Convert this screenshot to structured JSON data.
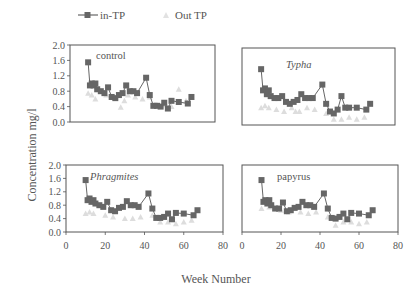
{
  "legend": {
    "in_label": "in-TP",
    "out_label": "Out TP"
  },
  "axes": {
    "ylabel": "Concentration mg/l",
    "xlabel": "Week Number",
    "yticks": [
      "0.0",
      "0.4",
      "0.8",
      "1.2",
      "1.6",
      "2.0"
    ],
    "xticks": [
      "0",
      "20",
      "40",
      "60",
      "80"
    ]
  },
  "colors": {
    "in": "#666666",
    "out": "#dddddd",
    "frame": "#555555"
  },
  "chart_data": [
    {
      "type": "line",
      "title": "control",
      "xlabel": "Week Number",
      "ylabel": "Concentration mg/l",
      "xlim": [
        0,
        80
      ],
      "ylim": [
        0,
        2.0
      ],
      "series": [
        {
          "name": "in-TP",
          "x": [
            10,
            11,
            12,
            13,
            14,
            15,
            17,
            19,
            21,
            23,
            25,
            27,
            29,
            31,
            33,
            35,
            37,
            42,
            44,
            46,
            48,
            50,
            52,
            54,
            56,
            60,
            65,
            67
          ],
          "y": [
            1.55,
            0.95,
            1.0,
            0.95,
            1.0,
            0.85,
            0.8,
            0.75,
            0.9,
            0.65,
            0.62,
            0.7,
            0.75,
            0.95,
            0.8,
            0.8,
            0.75,
            1.15,
            0.7,
            0.42,
            0.42,
            0.4,
            0.5,
            0.35,
            0.55,
            0.52,
            0.48,
            0.65
          ]
        },
        {
          "name": "Out TP",
          "x": [
            10,
            12,
            14,
            16,
            20,
            24,
            28,
            30,
            32,
            36,
            40,
            44,
            48,
            52,
            56,
            60,
            64,
            67
          ],
          "y": [
            0.75,
            0.7,
            0.6,
            0.85,
            0.7,
            0.65,
            0.38,
            0.55,
            0.7,
            0.65,
            0.6,
            0.65,
            0.45,
            0.45,
            0.4,
            0.85,
            0.55,
            0.65
          ]
        }
      ]
    },
    {
      "type": "line",
      "title": "Typha",
      "xlim": [
        0,
        80
      ],
      "ylim": [
        0,
        2.0
      ],
      "series": [
        {
          "name": "in-TP",
          "x": [
            10,
            11,
            12,
            13,
            14,
            15,
            17,
            19,
            21,
            23,
            25,
            27,
            29,
            31,
            33,
            35,
            37,
            42,
            44,
            46,
            48,
            50,
            52,
            54,
            56,
            60,
            65,
            67
          ],
          "y": [
            1.45,
            0.9,
            0.95,
            0.8,
            0.9,
            0.75,
            0.7,
            0.7,
            0.75,
            0.6,
            0.55,
            0.6,
            0.65,
            0.8,
            0.7,
            0.7,
            0.7,
            1.05,
            0.55,
            0.35,
            0.3,
            0.4,
            0.75,
            0.45,
            0.45,
            0.45,
            0.4,
            0.55
          ]
        },
        {
          "name": "Out TP",
          "x": [
            10,
            12,
            14,
            18,
            22,
            26,
            28,
            30,
            34,
            38,
            44,
            48,
            52,
            56,
            60,
            64
          ],
          "y": [
            0.45,
            0.5,
            0.45,
            0.4,
            0.35,
            0.45,
            0.35,
            0.35,
            0.45,
            0.4,
            0.3,
            0.15,
            0.15,
            0.2,
            0.15,
            0.2
          ]
        }
      ]
    },
    {
      "type": "line",
      "title": "Phragmites",
      "xlim": [
        0,
        80
      ],
      "ylim": [
        0,
        2.0
      ],
      "series": [
        {
          "name": "in-TP",
          "x": [
            10,
            11,
            12,
            13,
            14,
            15,
            17,
            19,
            21,
            23,
            25,
            27,
            29,
            31,
            33,
            35,
            37,
            42,
            44,
            46,
            48,
            50,
            52,
            54,
            56,
            60,
            65,
            67
          ],
          "y": [
            1.55,
            0.95,
            1.0,
            0.9,
            0.95,
            0.85,
            0.8,
            0.75,
            0.9,
            0.65,
            0.62,
            0.72,
            0.75,
            0.92,
            0.8,
            0.8,
            0.75,
            1.15,
            0.7,
            0.42,
            0.42,
            0.45,
            0.55,
            0.38,
            0.57,
            0.55,
            0.5,
            0.65
          ]
        },
        {
          "name": "Out TP",
          "x": [
            10,
            12,
            14,
            20,
            24,
            30,
            34,
            38,
            44,
            48,
            52,
            56,
            60,
            64
          ],
          "y": [
            0.55,
            0.6,
            0.55,
            0.5,
            0.45,
            0.4,
            0.4,
            0.45,
            0.5,
            0.3,
            0.3,
            0.25,
            0.3,
            0.35
          ]
        }
      ]
    },
    {
      "type": "line",
      "title": "papyrus",
      "xlim": [
        0,
        80
      ],
      "ylim": [
        0,
        2.0
      ],
      "series": [
        {
          "name": "in-TP",
          "x": [
            10,
            11,
            12,
            13,
            14,
            15,
            17,
            19,
            21,
            23,
            25,
            27,
            29,
            31,
            33,
            35,
            37,
            42,
            44,
            46,
            48,
            50,
            52,
            54,
            56,
            60,
            65,
            67
          ],
          "y": [
            1.55,
            0.9,
            0.95,
            0.85,
            0.95,
            0.8,
            0.7,
            0.7,
            0.88,
            0.62,
            0.65,
            0.72,
            0.75,
            0.9,
            0.8,
            0.8,
            0.75,
            1.15,
            0.7,
            0.42,
            0.4,
            0.45,
            0.55,
            0.38,
            0.57,
            0.55,
            0.5,
            0.65
          ]
        },
        {
          "name": "Out TP",
          "x": [
            10,
            14,
            20,
            24,
            30,
            34,
            38,
            44,
            48,
            52,
            56,
            60,
            64
          ],
          "y": [
            0.7,
            0.75,
            0.65,
            0.6,
            0.6,
            0.55,
            0.6,
            0.45,
            0.2,
            0.3,
            0.3,
            0.25,
            0.3
          ]
        }
      ]
    }
  ],
  "panels": [
    {
      "label": "control",
      "italic": false,
      "box": [
        70,
        45,
        145,
        77
      ],
      "label_pos": [
        96,
        59
      ],
      "show_yticks": true,
      "show_xticks": false
    },
    {
      "label": "Typha",
      "italic": true,
      "box": [
        242,
        48,
        153,
        77
      ],
      "label_pos": [
        286,
        68
      ],
      "show_yticks": false,
      "show_xticks": false
    },
    {
      "label": "Phragmites",
      "italic": true,
      "box": [
        66,
        165,
        157,
        67
      ],
      "label_pos": [
        90,
        180
      ],
      "show_yticks": true,
      "show_xticks": true
    },
    {
      "label": "papyrus",
      "italic": false,
      "box": [
        242,
        165,
        156,
        67
      ],
      "label_pos": [
        277,
        180
      ],
      "show_yticks": false,
      "show_xticks": true
    }
  ]
}
